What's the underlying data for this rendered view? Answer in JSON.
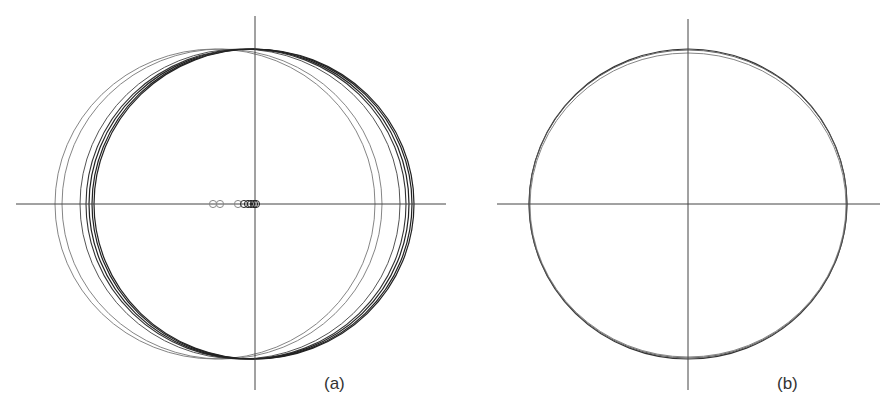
{
  "figure": {
    "panels": [
      {
        "id": "a",
        "label": "(a)",
        "label_pos": [
          324,
          391
        ],
        "axes": {
          "h": {
            "x1": 16,
            "x2": 446,
            "y": 204
          },
          "v": {
            "x": 255,
            "y1": 16,
            "y2": 390
          }
        },
        "ellipses": [
          {
            "cx": 215,
            "cy": 204,
            "rx": 160,
            "ry": 155,
            "stroke": "#777777",
            "width": 0.9
          },
          {
            "cx": 222,
            "cy": 204,
            "rx": 160,
            "ry": 155,
            "stroke": "#777777",
            "width": 0.9
          },
          {
            "cx": 240,
            "cy": 204,
            "rx": 160,
            "ry": 155,
            "stroke": "#555555",
            "width": 1.0
          },
          {
            "cx": 246,
            "cy": 204,
            "rx": 160,
            "ry": 155,
            "stroke": "#333333",
            "width": 1.1
          },
          {
            "cx": 249,
            "cy": 204,
            "rx": 160,
            "ry": 155,
            "stroke": "#222222",
            "width": 1.2
          },
          {
            "cx": 252,
            "cy": 204,
            "rx": 160,
            "ry": 155,
            "stroke": "#222222",
            "width": 1.2
          },
          {
            "cx": 254,
            "cy": 204,
            "rx": 160,
            "ry": 155,
            "stroke": "#222222",
            "width": 1.2
          }
        ],
        "markers": [
          {
            "cx": 213,
            "cy": 204,
            "r": 3.6,
            "stroke": "#888888"
          },
          {
            "cx": 220,
            "cy": 204,
            "r": 3.6,
            "stroke": "#888888"
          },
          {
            "cx": 238,
            "cy": 204,
            "r": 3.6,
            "stroke": "#888888"
          },
          {
            "cx": 244,
            "cy": 204,
            "r": 3.6,
            "stroke": "#333333"
          },
          {
            "cx": 248,
            "cy": 204,
            "r": 3.6,
            "stroke": "#222222"
          },
          {
            "cx": 251,
            "cy": 204,
            "r": 3.6,
            "stroke": "#222222"
          },
          {
            "cx": 254,
            "cy": 204,
            "r": 3.6,
            "stroke": "#222222"
          },
          {
            "cx": 256,
            "cy": 204,
            "r": 3.6,
            "stroke": "#222222"
          }
        ]
      },
      {
        "id": "b",
        "label": "(b)",
        "label_pos": [
          777,
          391
        ],
        "axes": {
          "h": {
            "x1": 497,
            "x2": 880,
            "y": 204
          },
          "v": {
            "x": 688,
            "y1": 19,
            "y2": 390
          }
        },
        "ellipses": [
          {
            "cx": 688,
            "cy": 204,
            "rx": 159,
            "ry": 155,
            "stroke": "#333333",
            "width": 1.1
          },
          {
            "cx": 688,
            "cy": 205,
            "rx": 158,
            "ry": 152,
            "stroke": "#777777",
            "width": 0.9
          },
          {
            "cx": 688,
            "cy": 204,
            "rx": 159,
            "ry": 154,
            "stroke": "#555555",
            "width": 0.9
          }
        ],
        "markers": []
      }
    ],
    "axis_color": "#444444"
  }
}
